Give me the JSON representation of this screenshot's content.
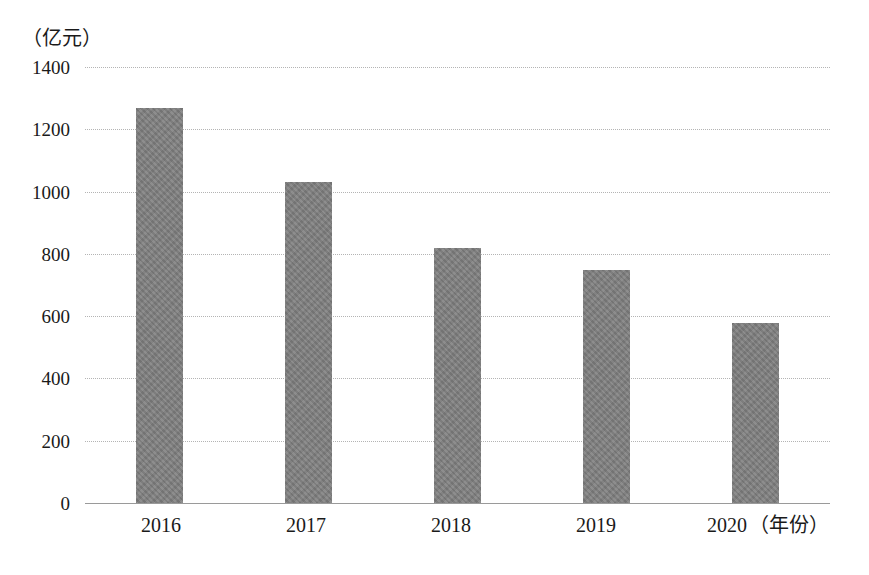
{
  "chart_data": {
    "type": "bar",
    "title": "",
    "subtitle": "",
    "xlabel": "（年份）",
    "ylabel": "（亿元）",
    "categories": [
      "2016",
      "2017",
      "2018",
      "2019",
      "2020"
    ],
    "values": [
      1270,
      1030,
      820,
      747,
      578
    ],
    "series": [
      {
        "name": "",
        "values": [
          1270,
          1030,
          820,
          747,
          578
        ]
      }
    ],
    "ylim": [
      0,
      1400
    ],
    "y_ticks": [
      0,
      200,
      400,
      600,
      800,
      1000,
      1200,
      1400
    ],
    "y_tick_labels": [
      "0",
      "200",
      "400",
      "600",
      "800",
      "1000",
      "1200",
      "1400"
    ],
    "x_tick_labels": [
      "2016",
      "2017",
      "2018",
      "2019",
      "2020"
    ],
    "grid": true,
    "grid_style": "dotted horizontal",
    "legend": null,
    "legend_position": "none",
    "annotations": [],
    "bar_color": "#7e7e7e",
    "grid_color": "#b4b4b4",
    "axis_color": "#9a9a9a",
    "background_color": "#ffffff",
    "axis_caption_suffix": "（年份）"
  }
}
